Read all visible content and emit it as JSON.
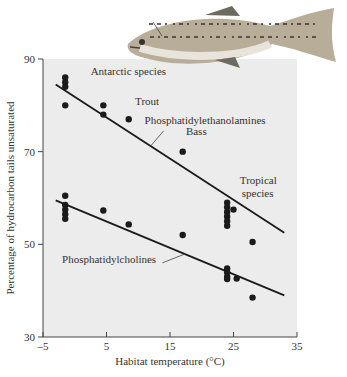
{
  "chart_data": {
    "type": "scatter",
    "title": "",
    "xlabel": "Habitat temperature (°C)",
    "ylabel": "Percentage of hydrocarbon tails unsaturated",
    "xlim": [
      -5,
      35
    ],
    "ylim": [
      30,
      90
    ],
    "xticks": [
      -5,
      5,
      15,
      25,
      35
    ],
    "yticks": [
      30,
      50,
      70,
      90
    ],
    "xtick_labels": [
      "–5",
      "5",
      "15",
      "25",
      "35"
    ],
    "ytick_labels": [
      "30",
      "50",
      "70",
      "90"
    ],
    "grid": false,
    "series": [
      {
        "name": "Phosphatidylethanolamines",
        "points": [
          [
            -1.5,
            86
          ],
          [
            -1.5,
            85
          ],
          [
            -1.5,
            84
          ],
          [
            -1.5,
            80
          ],
          [
            4.5,
            80
          ],
          [
            4.5,
            78
          ],
          [
            8.5,
            77
          ],
          [
            17,
            70
          ],
          [
            24,
            59
          ],
          [
            24,
            58
          ],
          [
            24,
            57
          ],
          [
            24,
            56
          ],
          [
            24,
            55
          ],
          [
            24,
            54
          ],
          [
            25,
            57.5
          ],
          [
            28,
            50.5
          ]
        ],
        "fit_line": [
          [
            -3,
            84.5
          ],
          [
            33,
            52.5
          ]
        ]
      },
      {
        "name": "Phosphatidylcholines",
        "points": [
          [
            -1.5,
            60.5
          ],
          [
            -1.5,
            58.5
          ],
          [
            -1.5,
            57.5
          ],
          [
            -1.5,
            56.5
          ],
          [
            -1.5,
            55.5
          ],
          [
            4.5,
            57.3
          ],
          [
            8.5,
            54.3
          ],
          [
            17,
            52
          ],
          [
            24,
            44.8
          ],
          [
            24,
            44
          ],
          [
            24,
            43
          ],
          [
            24,
            42.5
          ],
          [
            25.5,
            42.6
          ],
          [
            28,
            38.5
          ]
        ],
        "fit_line": [
          [
            -3,
            59.5
          ],
          [
            33,
            39
          ]
        ]
      }
    ],
    "annotations": [
      {
        "text": "Antarctic species",
        "x": 2.5,
        "y": 86.5
      },
      {
        "text": "Trout",
        "x": 9.5,
        "y": 80
      },
      {
        "text": "Phosphatidylethanolamines",
        "x": 11,
        "y": 76
      },
      {
        "text": "Bass",
        "x": 17.5,
        "y": 73.5
      },
      {
        "text": "Tropical",
        "x": 26,
        "y": 63
      },
      {
        "text": "species",
        "x": 26.3,
        "y": 60.2
      },
      {
        "text": "Phosphatidylcholines",
        "x": -2,
        "y": 46
      },
      {
        "text": "Brain",
        "x": 16,
        "y": 108
      }
    ]
  },
  "illustration": {
    "name": "trout-fish",
    "label": "Brain"
  }
}
